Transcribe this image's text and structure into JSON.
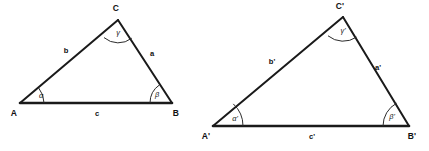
{
  "figure": {
    "background_color": "#ffffff",
    "line_color": "#1a1a1a",
    "text_color": "#111111",
    "triangles": [
      {
        "name": "triangle-abc",
        "vertices": {
          "A": {
            "label": "A",
            "x": 20,
            "y": 103
          },
          "B": {
            "label": "B",
            "x": 172,
            "y": 103
          },
          "C": {
            "label": "C",
            "x": 118,
            "y": 20
          }
        },
        "vertex_labels": {
          "A": {
            "text": "A",
            "x": 14,
            "y": 114
          },
          "B": {
            "text": "B",
            "x": 176,
            "y": 114
          },
          "C": {
            "text": "C",
            "x": 116,
            "y": 9
          }
        },
        "sides": [
          {
            "name": "side-a",
            "label": "a",
            "from": "C",
            "to": "B",
            "label_x": 152,
            "label_y": 54
          },
          {
            "name": "side-b",
            "label": "b",
            "from": "A",
            "to": "C",
            "label_x": 66,
            "label_y": 51
          },
          {
            "name": "side-c",
            "label": "c",
            "from": "A",
            "to": "B",
            "label_x": 97,
            "label_y": 114,
            "emphasis": "thick"
          }
        ],
        "angles": [
          {
            "name": "angle-alpha",
            "label": "α",
            "at": "A",
            "label_x": 41,
            "label_y": 96,
            "arc_radius": 24
          },
          {
            "name": "angle-beta",
            "label": "β",
            "at": "B",
            "label_x": 157,
            "label_y": 95,
            "arc_radius": 22
          },
          {
            "name": "angle-gamma",
            "label": "γ",
            "at": "C",
            "label_x": 118,
            "label_y": 33,
            "arc_radius": 22
          }
        ]
      },
      {
        "name": "triangle-abc-prime",
        "vertices": {
          "A": {
            "label": "A'",
            "x": 213,
            "y": 126
          },
          "B": {
            "label": "B'",
            "x": 409,
            "y": 126
          },
          "C": {
            "label": "C'",
            "x": 343,
            "y": 17
          }
        },
        "vertex_labels": {
          "A": {
            "text": "A'",
            "x": 206,
            "y": 137
          },
          "B": {
            "text": "B'",
            "x": 412,
            "y": 137
          },
          "C": {
            "text": "C'",
            "x": 340,
            "y": 7
          }
        },
        "sides": [
          {
            "name": "side-a-prime",
            "label": "a'",
            "from": "C",
            "to": "B",
            "label_x": 378,
            "label_y": 68
          },
          {
            "name": "side-b-prime",
            "label": "b'",
            "from": "A",
            "to": "C",
            "label_x": 272,
            "label_y": 62
          },
          {
            "name": "side-c-prime",
            "label": "c'",
            "from": "A",
            "to": "B",
            "label_x": 312,
            "label_y": 137,
            "emphasis": "thick"
          }
        ],
        "angles": [
          {
            "name": "angle-alpha-prime",
            "label": "α'",
            "at": "A",
            "label_x": 235,
            "label_y": 119,
            "arc_radius": 30
          },
          {
            "name": "angle-beta-prime",
            "label": "β'",
            "at": "B",
            "label_x": 392,
            "label_y": 117,
            "arc_radius": 26
          },
          {
            "name": "angle-gamma-prime",
            "label": "γ'",
            "at": "C",
            "label_x": 343,
            "label_y": 31,
            "arc_radius": 24
          }
        ]
      }
    ]
  },
  "labels": {
    "left": {
      "vertex_a": "A",
      "vertex_b": "B",
      "vertex_c": "C",
      "side_a": "a",
      "side_b": "b",
      "side_c": "c",
      "angle_alpha": "α",
      "angle_beta": "β",
      "angle_gamma": "γ"
    },
    "right": {
      "vertex_a": "A'",
      "vertex_b": "B'",
      "vertex_c": "C'",
      "side_a": "a'",
      "side_b": "b'",
      "side_c": "c'",
      "angle_alpha": "α'",
      "angle_beta": "β'",
      "angle_gamma": "γ'"
    }
  }
}
